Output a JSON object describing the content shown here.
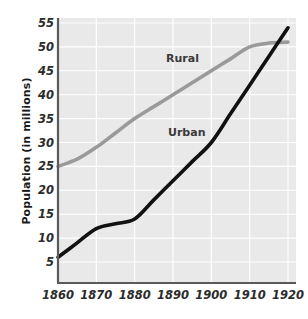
{
  "chart_data": {
    "type": "line",
    "title": "",
    "xlabel": "",
    "ylabel": "Population (in millions)",
    "x": [
      1860,
      1870,
      1880,
      1890,
      1900,
      1910,
      1920
    ],
    "xtick_labels": [
      "1860",
      "1870",
      "1880",
      "1890",
      "1900",
      "1910",
      "1920"
    ],
    "ytick_labels": [
      "5",
      "10",
      "15",
      "20",
      "25",
      "30",
      "35",
      "40",
      "45",
      "50",
      "55"
    ],
    "ytick_values": [
      5,
      10,
      15,
      20,
      25,
      30,
      35,
      40,
      45,
      50,
      55
    ],
    "xlim": [
      1860,
      1920
    ],
    "ylim": [
      0,
      55
    ],
    "grid": true,
    "grid_color": "#ffffff",
    "plot_background": "#e9e9e9",
    "legend_position": "inline-annotations",
    "series": [
      {
        "name": "Rural",
        "color": "#9a9a9a",
        "label_text": "Rural",
        "values": [
          25,
          29,
          35,
          40,
          45,
          50,
          51
        ],
        "points": [
          {
            "x": 1860,
            "y": 25
          },
          {
            "x": 1865,
            "y": 26.5
          },
          {
            "x": 1870,
            "y": 29
          },
          {
            "x": 1875,
            "y": 32
          },
          {
            "x": 1880,
            "y": 35
          },
          {
            "x": 1885,
            "y": 37.5
          },
          {
            "x": 1890,
            "y": 40
          },
          {
            "x": 1895,
            "y": 42.5
          },
          {
            "x": 1900,
            "y": 45
          },
          {
            "x": 1905,
            "y": 47.5
          },
          {
            "x": 1910,
            "y": 50
          },
          {
            "x": 1915,
            "y": 50.8
          },
          {
            "x": 1920,
            "y": 51
          }
        ]
      },
      {
        "name": "Urban",
        "color": "#111111",
        "label_text": "Urban",
        "values": [
          6,
          12,
          14,
          22,
          30,
          42,
          54
        ],
        "points": [
          {
            "x": 1860,
            "y": 6
          },
          {
            "x": 1865,
            "y": 9
          },
          {
            "x": 1870,
            "y": 12
          },
          {
            "x": 1875,
            "y": 13
          },
          {
            "x": 1880,
            "y": 14
          },
          {
            "x": 1885,
            "y": 18
          },
          {
            "x": 1890,
            "y": 22
          },
          {
            "x": 1895,
            "y": 26
          },
          {
            "x": 1900,
            "y": 30
          },
          {
            "x": 1905,
            "y": 36
          },
          {
            "x": 1910,
            "y": 42
          },
          {
            "x": 1915,
            "y": 48
          },
          {
            "x": 1920,
            "y": 54
          }
        ]
      }
    ],
    "annotations": [
      {
        "text": "Rural",
        "series": "Rural"
      },
      {
        "text": "Urban",
        "series": "Urban"
      }
    ],
    "axis_color": "#5a5a5a",
    "crossover_year": 1917
  }
}
